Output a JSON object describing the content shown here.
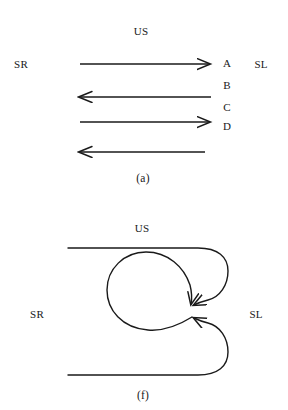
{
  "figure": {
    "width": 288,
    "height": 410,
    "background_color": "#ffffff",
    "stroke_color": "#1a1a1a",
    "text_color": "#191919"
  },
  "panels": [
    {
      "id": "a",
      "caption": "(a)",
      "labels": {
        "top": "US",
        "left": "SR",
        "right": "SL"
      },
      "sequence_labels": [
        "A",
        "B",
        "C",
        "D"
      ],
      "arrows": [
        {
          "name": "arrow-a-1",
          "direction": "right",
          "row_label": "A"
        },
        {
          "name": "arrow-a-2",
          "direction": "left",
          "row_label": "B"
        },
        {
          "name": "arrow-a-3",
          "direction": "right",
          "row_label": "C"
        },
        {
          "name": "arrow-a-4",
          "direction": "left",
          "row_label": "D"
        }
      ]
    },
    {
      "id": "f",
      "caption": "(f)",
      "labels": {
        "top": "US",
        "left": "SR",
        "right": "SL"
      },
      "elements": [
        {
          "name": "top-line-loop",
          "description": "horizontal line curving down into arrowhead"
        },
        {
          "name": "bottom-line-loop",
          "description": "horizontal line curving up into arrowhead"
        },
        {
          "name": "center-circle",
          "description": "closed loop circle converging on arrowheads"
        }
      ]
    }
  ]
}
